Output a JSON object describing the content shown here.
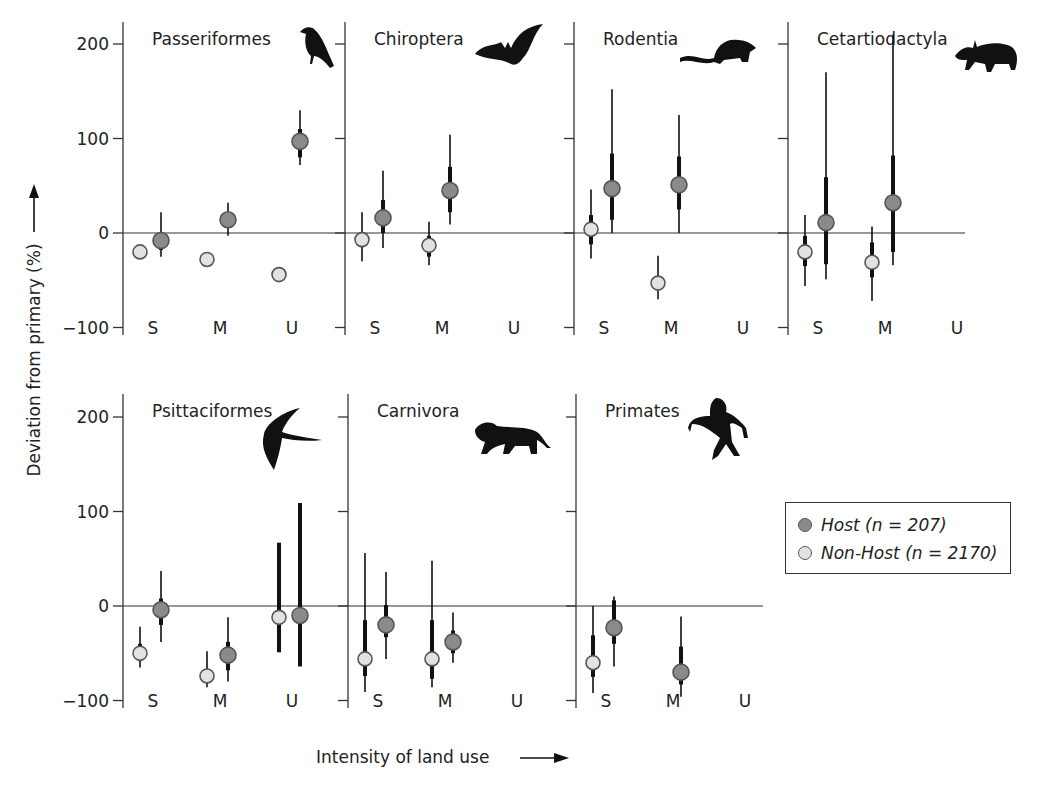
{
  "figure": {
    "y_axis_title": "Deviation from primary (%)",
    "x_axis_title": "Intensity of land use",
    "y_ticks": [
      200,
      100,
      0,
      -100
    ],
    "y_tick_labels": [
      "200",
      "100",
      "0",
      "−100"
    ],
    "categories": [
      "S",
      "M",
      "U"
    ],
    "colors": {
      "host": "#8a8a8a",
      "non_host": "#e2e2e2",
      "bar": "#111111",
      "outline": "#555555"
    }
  },
  "legend": {
    "host_label": "Host (n = 207)",
    "non_host_label": "Non-Host (n = 2170)"
  },
  "chart_data": {
    "type": "scatter",
    "title": "",
    "xlabel": "Intensity of land use",
    "ylabel": "Deviation from primary (%)",
    "ylim": [
      -100,
      220
    ],
    "categories": [
      "S",
      "M",
      "U"
    ],
    "legend_position": "right",
    "grid": false,
    "series_names": [
      "Host (n = 207)",
      "Non-Host (n = 2170)"
    ],
    "panels": [
      {
        "name": "Passeriformes",
        "icon": "crow-silhouette-icon",
        "row": 0,
        "col": 0,
        "points": [
          {
            "series": "Non-Host",
            "cat": "S",
            "value": -20,
            "thick": null,
            "thin": null
          },
          {
            "series": "Host",
            "cat": "S",
            "value": -8,
            "thick": [
              -18,
              -2
            ],
            "thin": [
              -25,
              22
            ]
          },
          {
            "series": "Non-Host",
            "cat": "M",
            "value": -28,
            "thick": null,
            "thin": null
          },
          {
            "series": "Host",
            "cat": "M",
            "value": 14,
            "thick": null,
            "thin": [
              -3,
              32
            ]
          },
          {
            "series": "Non-Host",
            "cat": "U",
            "value": -44,
            "thick": null,
            "thin": [
              -48,
              -40
            ]
          },
          {
            "series": "Host",
            "cat": "U",
            "value": 97,
            "thick": [
              80,
              110
            ],
            "thin": [
              72,
              130
            ]
          }
        ]
      },
      {
        "name": "Chiroptera",
        "icon": "bat-silhouette-icon",
        "row": 0,
        "col": 1,
        "points": [
          {
            "series": "Non-Host",
            "cat": "S",
            "value": -7,
            "thick": [
              -15,
              0
            ],
            "thin": [
              -30,
              22
            ]
          },
          {
            "series": "Host",
            "cat": "S",
            "value": 16,
            "thick": [
              0,
              35
            ],
            "thin": [
              -16,
              66
            ]
          },
          {
            "series": "Non-Host",
            "cat": "M",
            "value": -13,
            "thick": [
              -25,
              -3
            ],
            "thin": [
              -34,
              12
            ]
          },
          {
            "series": "Host",
            "cat": "M",
            "value": 45,
            "thick": [
              22,
              70
            ],
            "thin": [
              9,
              104
            ]
          }
        ]
      },
      {
        "name": "Rodentia",
        "icon": "rat-silhouette-icon",
        "row": 0,
        "col": 2,
        "points": [
          {
            "series": "Non-Host",
            "cat": "S",
            "value": 4,
            "thick": [
              -12,
              19
            ],
            "thin": [
              -27,
              46
            ]
          },
          {
            "series": "Host",
            "cat": "S",
            "value": 47,
            "thick": [
              14,
              84
            ],
            "thin": [
              0,
              152
            ]
          },
          {
            "series": "Non-Host",
            "cat": "M",
            "value": -53,
            "thick": null,
            "thin": [
              -70,
              -24
            ]
          },
          {
            "series": "Host",
            "cat": "M",
            "value": 51,
            "thick": [
              25,
              81
            ],
            "thin": [
              0,
              125
            ]
          }
        ]
      },
      {
        "name": "Cetartiodactyla",
        "icon": "boar-silhouette-icon",
        "row": 0,
        "col": 3,
        "points": [
          {
            "series": "Non-Host",
            "cat": "S",
            "value": -20,
            "thick": [
              -35,
              -3
            ],
            "thin": [
              -56,
              19
            ]
          },
          {
            "series": "Host",
            "cat": "S",
            "value": 11,
            "thick": [
              -33,
              59
            ],
            "thin": [
              -49,
              170
            ]
          },
          {
            "series": "Non-Host",
            "cat": "M",
            "value": -31,
            "thick": [
              -47,
              -10
            ],
            "thin": [
              -72,
              7
            ]
          },
          {
            "series": "Host",
            "cat": "M",
            "value": 32,
            "thick": [
              -20,
              82
            ],
            "thin": [
              -34,
              210
            ]
          }
        ]
      },
      {
        "name": "Psittaciformes",
        "icon": "parrot-silhouette-icon",
        "row": 1,
        "col": 0,
        "points": [
          {
            "series": "Non-Host",
            "cat": "S",
            "value": -50,
            "thick": [
              -58,
              -40
            ],
            "thin": [
              -65,
              -22
            ]
          },
          {
            "series": "Host",
            "cat": "S",
            "value": -4,
            "thick": [
              -20,
              8
            ],
            "thin": [
              -38,
              37
            ]
          },
          {
            "series": "Non-Host",
            "cat": "M",
            "value": -74,
            "thick": null,
            "thin": [
              -86,
              -48
            ]
          },
          {
            "series": "Host",
            "cat": "M",
            "value": -52,
            "thick": [
              -68,
              -38
            ],
            "thin": [
              -80,
              -12
            ]
          },
          {
            "series": "Non-Host",
            "cat": "U",
            "value": -12,
            "thick": [
              -49,
              67
            ],
            "thin": null
          },
          {
            "series": "Host",
            "cat": "U",
            "value": -10,
            "thick": [
              -64,
              109
            ],
            "thin": null
          }
        ]
      },
      {
        "name": "Carnivora",
        "icon": "lion-silhouette-icon",
        "row": 1,
        "col": 1,
        "points": [
          {
            "series": "Non-Host",
            "cat": "S",
            "value": -56,
            "thick": [
              -74,
              -15
            ],
            "thin": [
              -91,
              56
            ]
          },
          {
            "series": "Host",
            "cat": "S",
            "value": -20,
            "thick": [
              -33,
              1
            ],
            "thin": [
              -56,
              36
            ]
          },
          {
            "series": "Non-Host",
            "cat": "M",
            "value": -56,
            "thick": [
              -77,
              -15
            ],
            "thin": [
              -86,
              48
            ]
          },
          {
            "series": "Host",
            "cat": "M",
            "value": -38,
            "thick": [
              -50,
              -26
            ],
            "thin": [
              -60,
              -7
            ]
          }
        ]
      },
      {
        "name": "Primates",
        "icon": "primate-silhouette-icon",
        "row": 1,
        "col": 2,
        "points": [
          {
            "series": "Non-Host",
            "cat": "S",
            "value": -60,
            "thick": [
              -75,
              -31
            ],
            "thin": [
              -92,
              0
            ]
          },
          {
            "series": "Host",
            "cat": "S",
            "value": -23,
            "thick": [
              -40,
              6
            ],
            "thin": [
              -64,
              10
            ]
          },
          {
            "series": "Host",
            "cat": "M",
            "value": -70,
            "thick": [
              -83,
              -43
            ],
            "thin": [
              -96,
              -11
            ]
          }
        ]
      }
    ]
  }
}
